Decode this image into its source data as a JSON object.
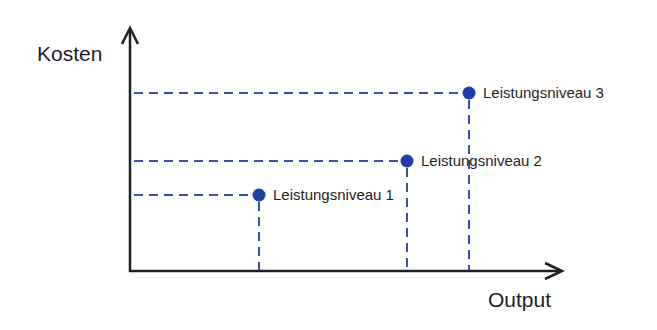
{
  "diagram": {
    "y_axis_label": "Kosten",
    "x_axis_label": "Output",
    "colors": {
      "axis": "#1e1e24",
      "dashed_lines": "#3a4fa8",
      "points": "#1f3fa6",
      "text": "#1e1e24"
    },
    "points": [
      {
        "label": "Leistungsniveau 1",
        "x": 259,
        "y": 195
      },
      {
        "label": "Leistungsniveau 2",
        "x": 407,
        "y": 161
      },
      {
        "label": "Leistungsniveau 3",
        "x": 469,
        "y": 93
      }
    ]
  }
}
